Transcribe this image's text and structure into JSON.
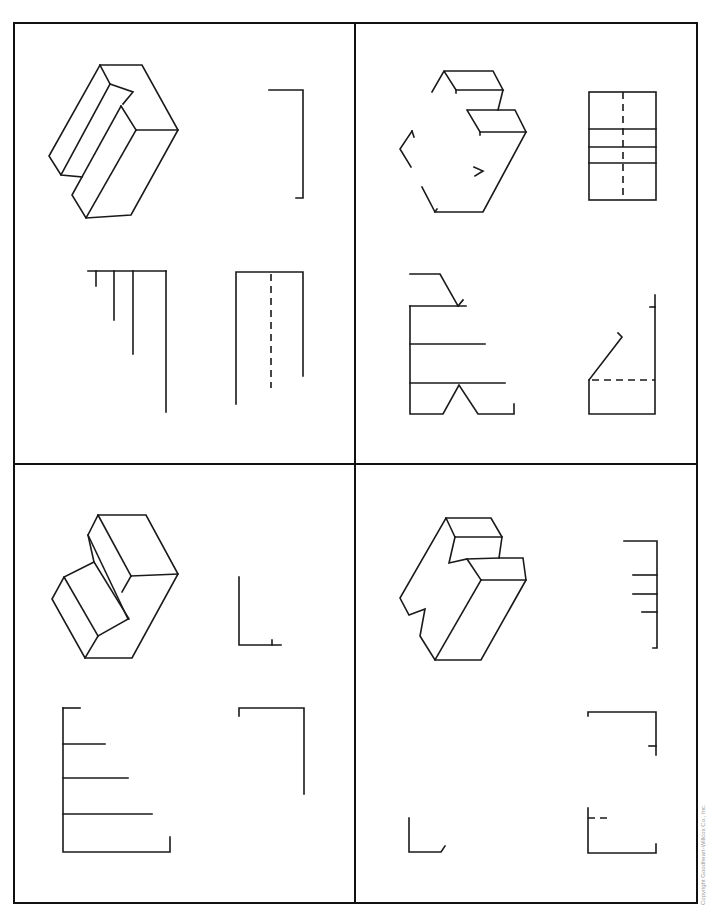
{
  "worksheet": {
    "layout": "2x2 grid of exercise panels",
    "panels": [
      {
        "id": "top-left",
        "isometric": "notched block (isometric pictorial)",
        "views": [
          "partial view right: bracket",
          "partial view: stepped lines",
          "partial view: rectangle with hidden line"
        ]
      },
      {
        "id": "top-right",
        "isometric": "stepped block (incomplete pictorial)",
        "views": [
          "complete view with hidden centerline",
          "incomplete view with angled edge",
          "incomplete view with hidden line"
        ]
      },
      {
        "id": "bottom-left",
        "isometric": "offset step block (isometric pictorial)",
        "views": [
          "partial L view",
          "partial stepped view",
          "partial bracket view"
        ]
      },
      {
        "id": "bottom-right",
        "isometric": "double-notched block (isometric pictorial)",
        "views": [
          "partial tick view",
          "partial bracket view",
          "partial L view",
          "partial view with hidden line"
        ]
      }
    ]
  },
  "footer": {
    "copyright": "Copyright Goodheart-Willcox Co., Inc."
  },
  "colors": {
    "line": "#1a1a1a",
    "background": "#ffffff",
    "copyright_text": "#9a9a9a"
  }
}
